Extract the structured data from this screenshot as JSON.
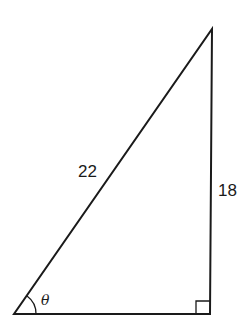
{
  "diagram": {
    "type": "right-triangle",
    "vertices": {
      "bottom_left": [
        14,
        314
      ],
      "bottom_right": [
        210,
        314
      ],
      "top": [
        212,
        29
      ]
    },
    "labels": {
      "hypotenuse": "22",
      "opposite": "18",
      "angle": "θ"
    },
    "right_angle_marker": "bottom-right",
    "stroke_color": "#1a1a1a"
  }
}
